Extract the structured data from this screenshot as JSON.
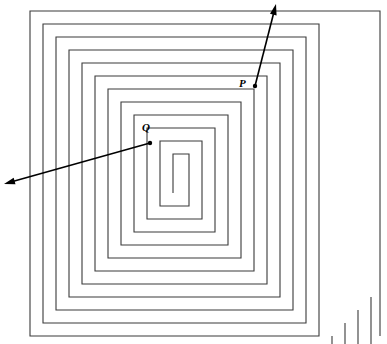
{
  "figure": {
    "type": "line-diagram",
    "width": 387,
    "height": 344,
    "background_color": "#ffffff",
    "stroke_color": "#3a3a3a",
    "annotation_color": "#000000",
    "ring_spacing_px": 13,
    "turns": 9,
    "opening_side": "bottom-right"
  },
  "labels": {
    "p": "P",
    "q": "Q"
  },
  "points": [
    {
      "name": "P",
      "label": "P",
      "x": 255,
      "y": 86
    },
    {
      "name": "Q",
      "label": "Q",
      "x": 150,
      "y": 143
    }
  ],
  "arrows": [
    {
      "name": "arrow-from-p",
      "from_label": "P",
      "x1": 255,
      "y1": 86,
      "x2": 276,
      "y2": 4,
      "head_at": "end",
      "direction": "up-right"
    },
    {
      "name": "arrow-from-q",
      "from_label": "Q",
      "x1": 150,
      "y1": 143,
      "x2": 4,
      "y2": 184,
      "head_at": "end",
      "direction": "down-left"
    }
  ],
  "geometry": {
    "outer_top_left_x": 30,
    "outer_top_left_y": 11,
    "outer_bottom_right_x": 380,
    "outer_bottom_right_y": 336,
    "spiral_path": "M 380,336 L 380,11 L 30,11 L 30,336 L 319,336 L 319,24 L 43,24 L 43,323 L 306,323 L 306,37 L 56,37 L 56,310 L 293,310 L 293,50 L 69,50 L 69,297 L 280,297 L 280,63 L 82,63 L 82,284 L 267,284 L 267,76 L 95,76 L 95,271 L 254,271 L 254,89 L 108,89 L 108,258 L 241,258 L 241,102 L 121,102 L 121,245 L 228,245 L 228,115 L 134,115 L 134,232 L 215,232 L 215,128 L 147,128 L 147,219 L 202,219 L 202,141 L 160,141 L 160,206 L 189,206 L 189,154 L 173,154 L 173,193",
    "tail_paths": [
      "M 332,336 L 332,349",
      "M 345,323 L 345,349",
      "M 358,310 L 358,349",
      "M 371,297 L 371,349"
    ]
  }
}
